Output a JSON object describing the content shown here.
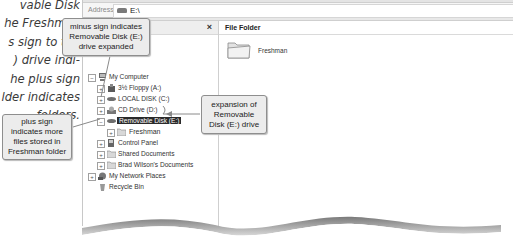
{
  "side_text": {
    "lines": [
      "vable Disk",
      "he Freshman",
      "s sign to the",
      ") drive indi-",
      "he plus sign",
      "lder indicates",
      "folders."
    ]
  },
  "window": {
    "address": {
      "label": "Address",
      "icon": "removable-drive-icon",
      "value": "E:\\"
    },
    "folders_pane": {
      "close_label": "×",
      "tree": [
        {
          "label": "My Computer",
          "icon": "computer-icon",
          "expander": "−",
          "level": 1
        },
        {
          "label": "3½ Floppy (A:)",
          "icon": "floppy-icon",
          "expander": "+",
          "level": 2
        },
        {
          "label": "LOCAL DISK (C:)",
          "icon": "hard-drive-icon",
          "expander": "+",
          "level": 2
        },
        {
          "label": "CD Drive (D:)",
          "icon": "cd-drive-icon",
          "expander": "+",
          "level": 2
        },
        {
          "label": "Removable Disk (E:)",
          "icon": "removable-drive-icon",
          "expander": "−",
          "level": 2,
          "selected": true
        },
        {
          "label": "Freshman",
          "icon": "folder-icon",
          "expander": "+",
          "level": 3
        },
        {
          "label": "Control Panel",
          "icon": "control-panel-icon",
          "expander": "+",
          "level": 2
        },
        {
          "label": "Shared Documents",
          "icon": "folder-icon",
          "expander": "+",
          "level": 2
        },
        {
          "label": "Brad Wilson's Documents",
          "icon": "folder-icon",
          "expander": "+",
          "level": 2
        },
        {
          "label": "My Network Places",
          "icon": "network-icon",
          "expander": "+",
          "level": 1
        },
        {
          "label": "Recycle Bin",
          "icon": "recycle-bin-icon",
          "expander": "",
          "level": 1
        }
      ]
    },
    "content_pane": {
      "header": "File Folder",
      "items": [
        {
          "label": "Freshman",
          "icon": "folder-icon"
        }
      ]
    }
  },
  "callouts": {
    "minus_sign": "minus sign indicates Removable Disk (E:) drive expanded",
    "minus_sign_lines": [
      "minus sign indicates",
      "Removable Disk (E:)",
      "drive expanded"
    ],
    "plus_sign_lines": [
      "plus sign",
      "indicates more",
      "files stored in",
      "Freshman folder"
    ],
    "expansion_lines": [
      "expansion of",
      "Removable",
      "Disk (E:) drive"
    ]
  }
}
